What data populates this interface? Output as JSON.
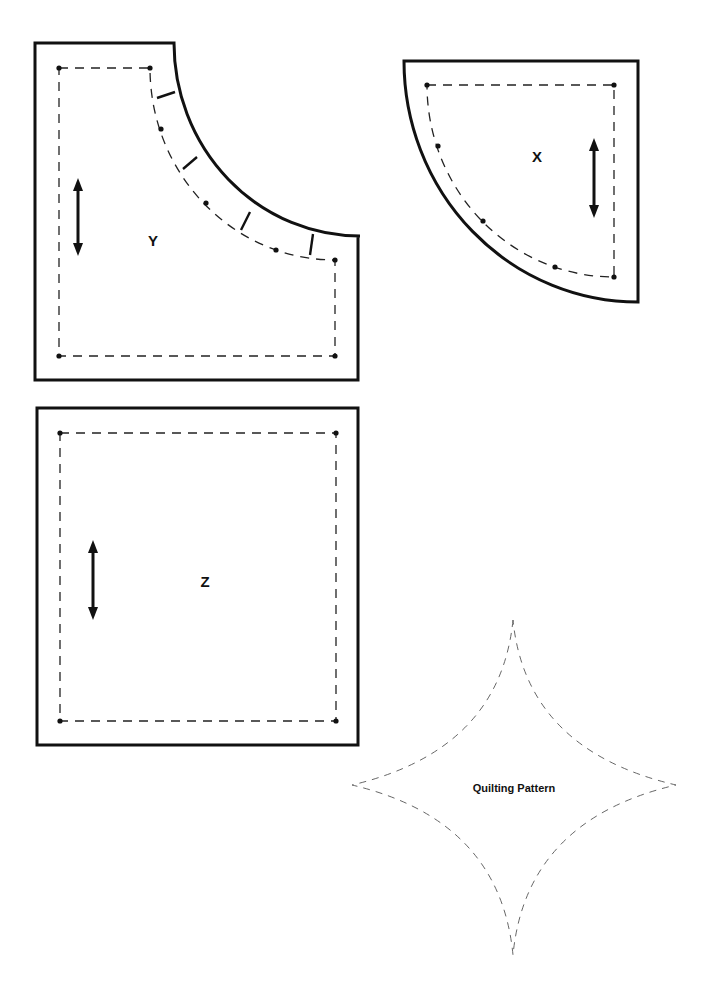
{
  "pieces": [
    {
      "id": "Y",
      "label": "Y",
      "shape": "square with concave quarter-circle cutout at top-right",
      "grain_arrow": "vertical",
      "notches": 4,
      "match_dots": 3
    },
    {
      "id": "X",
      "label": "X",
      "shape": "quarter circle",
      "grain_arrow": "vertical",
      "match_dots": 3
    },
    {
      "id": "Z",
      "label": "Z",
      "shape": "square",
      "grain_arrow": "vertical"
    }
  ],
  "quilting": {
    "label": "Quilting Pattern",
    "shape": "four-pointed concave star (dashed)"
  },
  "colors": {
    "line": "#111111",
    "background": "#ffffff",
    "quilt_line": "#555555"
  }
}
